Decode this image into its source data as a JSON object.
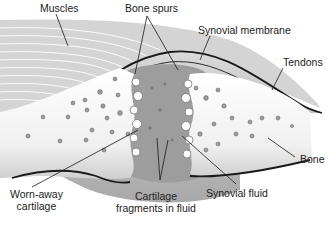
{
  "diagram": {
    "labels": {
      "muscles": "Muscles",
      "bone_spurs": "Bone spurs",
      "synovial_membrane": "Synovial membrane",
      "tendons": "Tendons",
      "bone": "Bone",
      "worn_away_cartilage_line1": "Worn-away",
      "worn_away_cartilage_line2": "cartilage",
      "cartilage_fragments_line1": "Cartilage",
      "cartilage_fragments_line2": "fragments in fluid",
      "synovial_fluid": "Synovial fluid"
    },
    "colors": {
      "bone": "#f4f4f4",
      "capsule": "#b8b8b8",
      "fluid": "#9a9a9a",
      "outline": "#1a1a1a",
      "pore": "#8a8a8a"
    }
  }
}
